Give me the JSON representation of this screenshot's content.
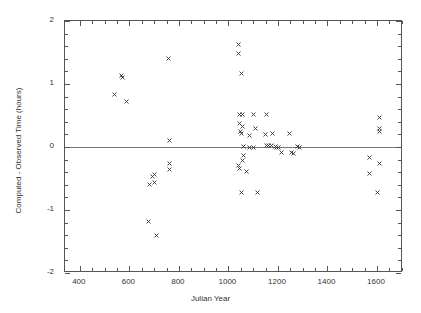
{
  "chart_data": {
    "type": "scatter",
    "title": "",
    "xlabel": "Julian Year",
    "ylabel": "Computed - Observed Time (hours)",
    "xlim": [
      340,
      1705
    ],
    "ylim": [
      -2,
      2
    ],
    "xticks": [
      400,
      600,
      800,
      1000,
      1200,
      1400,
      1600
    ],
    "yticks": [
      -2,
      -1,
      0,
      1,
      2
    ],
    "xtick_labels": [
      "400",
      "600",
      "800",
      "1000",
      "1200",
      "1400",
      "1600"
    ],
    "ytick_labels": [
      "-2",
      "-1",
      "0",
      "1",
      "2"
    ],
    "grid": false,
    "legend": null,
    "marker": "x",
    "marker_color": "#333333",
    "zero_line": 0,
    "zero_line_color": "#777777",
    "points": [
      {
        "x": 538,
        "y": 0.83
      },
      {
        "x": 570,
        "y": 1.14
      },
      {
        "x": 574,
        "y": 1.11
      },
      {
        "x": 590,
        "y": 0.72
      },
      {
        "x": 678,
        "y": -1.18
      },
      {
        "x": 683,
        "y": -0.59
      },
      {
        "x": 695,
        "y": -0.47
      },
      {
        "x": 703,
        "y": -0.44
      },
      {
        "x": 700,
        "y": -0.56
      },
      {
        "x": 711,
        "y": -1.41
      },
      {
        "x": 756,
        "y": 1.4
      },
      {
        "x": 763,
        "y": 0.11
      },
      {
        "x": 763,
        "y": -0.26
      },
      {
        "x": 763,
        "y": -0.35
      },
      {
        "x": 1041,
        "y": 1.62
      },
      {
        "x": 1041,
        "y": 1.48
      },
      {
        "x": 1053,
        "y": 1.17
      },
      {
        "x": 1043,
        "y": 0.52
      },
      {
        "x": 1055,
        "y": 0.52
      },
      {
        "x": 1100,
        "y": 0.52
      },
      {
        "x": 1155,
        "y": 0.52
      },
      {
        "x": 1045,
        "y": 0.37
      },
      {
        "x": 1057,
        "y": 0.32
      },
      {
        "x": 1108,
        "y": 0.29
      },
      {
        "x": 1179,
        "y": 0.22
      },
      {
        "x": 1245,
        "y": 0.22
      },
      {
        "x": 1049,
        "y": 0.25
      },
      {
        "x": 1053,
        "y": 0.22
      },
      {
        "x": 1085,
        "y": 0.18
      },
      {
        "x": 1150,
        "y": 0.2
      },
      {
        "x": 1061,
        "y": 0.01
      },
      {
        "x": 1087,
        "y": -0.01
      },
      {
        "x": 1100,
        "y": 0.0
      },
      {
        "x": 1155,
        "y": 0.03
      },
      {
        "x": 1163,
        "y": 0.02
      },
      {
        "x": 1175,
        "y": 0.02
      },
      {
        "x": 1190,
        "y": 0.01
      },
      {
        "x": 1196,
        "y": 0.0
      },
      {
        "x": 1202,
        "y": -0.01
      },
      {
        "x": 1280,
        "y": 0.01
      },
      {
        "x": 1287,
        "y": 0.0
      },
      {
        "x": 1216,
        "y": -0.09
      },
      {
        "x": 1253,
        "y": -0.08
      },
      {
        "x": 1262,
        "y": -0.1
      },
      {
        "x": 1061,
        "y": -0.13
      },
      {
        "x": 1057,
        "y": -0.21
      },
      {
        "x": 1041,
        "y": -0.29
      },
      {
        "x": 1045,
        "y": -0.34
      },
      {
        "x": 1073,
        "y": -0.39
      },
      {
        "x": 1053,
        "y": -0.73
      },
      {
        "x": 1118,
        "y": -0.73
      },
      {
        "x": 1568,
        "y": -0.16
      },
      {
        "x": 1612,
        "y": 0.47
      },
      {
        "x": 1612,
        "y": 0.29
      },
      {
        "x": 1610,
        "y": 0.25
      },
      {
        "x": 1568,
        "y": -0.42
      },
      {
        "x": 1610,
        "y": -0.26
      },
      {
        "x": 1600,
        "y": -0.73
      }
    ]
  }
}
